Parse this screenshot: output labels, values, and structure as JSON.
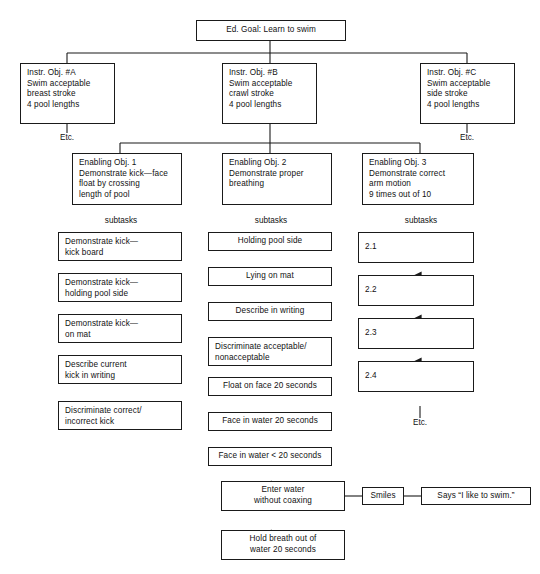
{
  "diagram": {
    "title_box": {
      "text": "Ed. Goal:  Learn to swim"
    },
    "objectives": [
      {
        "id": "A",
        "text": "Instr. Obj. #A\nSwim acceptable\nbreast stroke\n4 pool lengths"
      },
      {
        "id": "B",
        "text": "Instr. Obj. #B\nSwim acceptable\ncrawl stroke\n4 pool lengths"
      },
      {
        "id": "C",
        "text": "Instr. Obj. #C\nSwim acceptable\nside stroke\n4 pool lengths"
      }
    ],
    "etc_labels": {
      "left": "Etc.",
      "right": "Etc.",
      "bottom_right": "Etc."
    },
    "enabling": [
      {
        "id": "1",
        "text": "Enabling Obj. 1\nDemonstrate kick—face\nfloat by crossing\nlength of pool"
      },
      {
        "id": "2",
        "text": "Enabling Obj. 2\nDemonstrate proper\nbreathing"
      },
      {
        "id": "3",
        "text": "Enabling Obj. 3\nDemonstrate correct\narm motion\n9 times out of 10"
      }
    ],
    "subtasks_labels": {
      "col1": "subtasks",
      "col2": "subtasks",
      "col3": "subtasks"
    },
    "column1": [
      {
        "text": "Demonstrate kick—\nkick board"
      },
      {
        "text": "Demonstrate kick—\nholding pool side"
      },
      {
        "text": "Demonstrate kick—\non mat"
      },
      {
        "text": "Describe current\nkick in writing"
      },
      {
        "text": "Discriminate correct/\nincorrect kick"
      }
    ],
    "column2": [
      {
        "text": "Holding pool side"
      },
      {
        "text": "Lying on mat"
      },
      {
        "text": "Describe in writing"
      },
      {
        "text": "Discriminate acceptable/\nnonacceptable"
      },
      {
        "text": "Float on face 20 seconds"
      },
      {
        "text": "Face in water 20 seconds"
      },
      {
        "text": "Face in water < 20 seconds"
      }
    ],
    "column3": [
      {
        "text": "2.1"
      },
      {
        "text": "2.2"
      },
      {
        "text": "2.3"
      },
      {
        "text": "2.4"
      }
    ],
    "bottom": {
      "enter_water": {
        "text": "Enter water\nwithout coaxing"
      },
      "hold_breath": {
        "text": "Hold breath out of\nwater 20 seconds"
      },
      "smiles": {
        "text": "Smiles"
      },
      "says": {
        "text": "Says “I like to swim.”"
      }
    }
  },
  "style": {
    "line_color": "#1a1a1a",
    "box_fill": "#ffffff"
  }
}
